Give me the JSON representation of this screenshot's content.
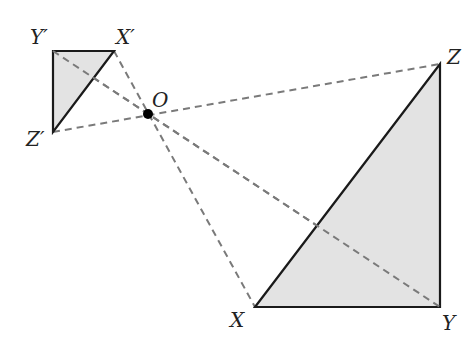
{
  "diagram": {
    "colors": {
      "fill": "#e3e3e3",
      "stroke": "#1a1a1a",
      "dash": "#7a7a7a",
      "point": "#000000"
    },
    "center": {
      "label": "O",
      "x": 148,
      "y": 114
    },
    "small_triangle": {
      "vertices": [
        {
          "label": "Y′",
          "x": 53,
          "y": 51
        },
        {
          "label": "X′",
          "x": 114,
          "y": 51
        },
        {
          "label": "Z′",
          "x": 53,
          "y": 132
        }
      ]
    },
    "large_triangle": {
      "vertices": [
        {
          "label": "Z",
          "x": 440,
          "y": 64
        },
        {
          "label": "X",
          "x": 255,
          "y": 307
        },
        {
          "label": "Y",
          "x": 440,
          "y": 307
        }
      ]
    },
    "labels": {
      "Yp": "Y′",
      "Xp": "X′",
      "Zp": "Z′",
      "O": "O",
      "Z": "Z",
      "X": "X",
      "Y": "Y"
    }
  }
}
